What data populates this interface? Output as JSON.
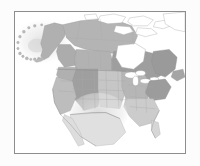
{
  "figure": {
    "name": "north-america-range-map",
    "title": "Range map of North America",
    "frame": {
      "visible": true,
      "color": "#8d8d8d",
      "line_width": 1
    },
    "background": "#ffffff"
  },
  "legend_colors": {
    "range_dark": "#9a9a9a",
    "range_medium": "#b4b4b4",
    "range_light": "#cfcfcf",
    "range_faint": "#e2e2e2",
    "unshaded_land": "#ffffff",
    "water": "#ffffff",
    "coastline": "#9b9b9b",
    "internal_border": "#b0b0b0",
    "frame": "#8d8d8d"
  },
  "map_regions": [
    {
      "id": "alaska-halo",
      "label": "Bering Sea / Alaska halo",
      "shade": "range_faint"
    },
    {
      "id": "aleutian-islands",
      "label": "Aleutian Islands",
      "shade": "range_light"
    },
    {
      "id": "alaska-mainland",
      "label": "Alaska",
      "shade": "range_medium"
    },
    {
      "id": "yukon-nwt",
      "label": "Yukon and Northwest Territories",
      "shade": "range_medium"
    },
    {
      "id": "arctic-archipelago",
      "label": "Canadian Arctic Archipelago",
      "shade": "unshaded_land"
    },
    {
      "id": "british-columbia",
      "label": "British Columbia",
      "shade": "range_medium"
    },
    {
      "id": "prairie-provinces",
      "label": "Alberta, Saskatchewan, Manitoba",
      "shade": "range_medium"
    },
    {
      "id": "hudson-bay",
      "label": "Hudson Bay",
      "shade": "water"
    },
    {
      "id": "ontario-quebec",
      "label": "Ontario and Quebec",
      "shade": "range_dark"
    },
    {
      "id": "labrador-maritimes",
      "label": "Labrador and Maritime provinces",
      "shade": "range_dark"
    },
    {
      "id": "greenland-edge",
      "label": "Greenland margin",
      "shade": "unshaded_land"
    },
    {
      "id": "pacific-northwest",
      "label": "Pacific Northwest states",
      "shade": "range_medium"
    },
    {
      "id": "rocky-mountains",
      "label": "Rocky Mountain states",
      "shade": "range_dark"
    },
    {
      "id": "great-plains",
      "label": "Great Plains states",
      "shade": "range_light"
    },
    {
      "id": "great-lakes",
      "label": "Great Lakes",
      "shade": "water"
    },
    {
      "id": "northeast-us",
      "label": "Northeastern United States",
      "shade": "range_dark"
    },
    {
      "id": "southeast-us",
      "label": "Southeastern United States",
      "shade": "range_light"
    },
    {
      "id": "southwest-us",
      "label": "Southwestern United States",
      "shade": "range_faint"
    },
    {
      "id": "northern-mexico",
      "label": "Northern Mexico",
      "shade": "range_faint"
    }
  ],
  "annotations": {
    "labels_visible": false,
    "scale_bar": false,
    "north_arrow": false,
    "legend_box": false,
    "axis_ticks": false
  }
}
